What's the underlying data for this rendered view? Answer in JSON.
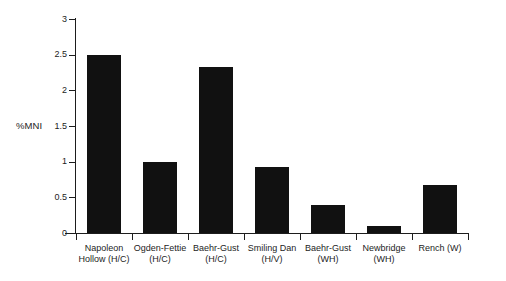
{
  "chart_data": {
    "type": "bar",
    "title": "",
    "subtitle": "",
    "xlabel": "",
    "ylabel": "%MNI",
    "ylim": [
      0,
      3
    ],
    "xlim": null,
    "grid": false,
    "legend": null,
    "legend_position": "none",
    "bar_color": "#111111",
    "axis_color": "#1d1d1d",
    "background_color": "#ffffff",
    "y_ticks": [
      "0",
      "0.5",
      "1",
      "1.5",
      "2",
      "2.5",
      "3"
    ],
    "y_tick_values": [
      0,
      0.5,
      1,
      1.5,
      2,
      2.5,
      3
    ],
    "categories": [
      "Napoleon\nHollow (H/C)",
      "Ogden-Fettie\n(H/C)",
      "Baehr-Gust\n(H/C)",
      "Smiling Dan\n(H/V)",
      "Baehr-Gust\n(WH)",
      "Newbridge\n(WH)",
      "Rench (W)"
    ],
    "categories_flat": [
      "Napoleon Hollow (H/C)",
      "Ogden-Fettie (H/C)",
      "Baehr-Gust (H/C)",
      "Smiling Dan (H/V)",
      "Baehr-Gust (WH)",
      "Newbridge (WH)",
      "Rench (W)"
    ],
    "values": [
      2.5,
      0.99,
      2.33,
      0.93,
      0.39,
      0.1,
      0.67
    ],
    "annotations": []
  }
}
